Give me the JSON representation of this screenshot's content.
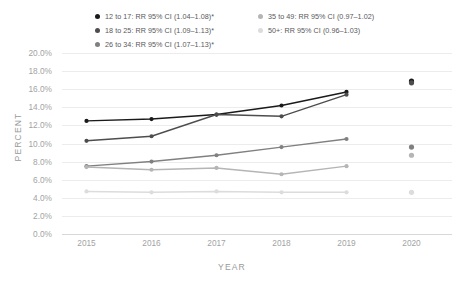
{
  "chart_data": {
    "type": "line",
    "title": "",
    "subtitle": "",
    "xlabel": "YEAR",
    "ylabel": "PERCENT",
    "x": [
      2015,
      2016,
      2017,
      2018,
      2019,
      2020
    ],
    "categories": [
      "2015",
      "2016",
      "2017",
      "2018",
      "2019",
      "2020"
    ],
    "xtick_labels": [
      "2015",
      "2016",
      "2017",
      "2018",
      "2019",
      "2020"
    ],
    "ytick_labels": [
      "0.0%",
      "2.0%",
      "4.0%",
      "6.0%",
      "8.0%",
      "10.0%",
      "12.0%",
      "14.0%",
      "16.0%",
      "18.0%",
      "20.0%"
    ],
    "ytick_values": [
      0,
      2,
      4,
      6,
      8,
      10,
      12,
      14,
      16,
      18,
      20
    ],
    "ylim": [
      0,
      20
    ],
    "grid": true,
    "legend_position": "top",
    "note": "2020 values are plotted as unconnected markers",
    "series": [
      {
        "name": "12 to 17",
        "legend_label": "12 to 17: RR 95% CI (1.04–1.08)*",
        "color": "#1a1a1a",
        "values": [
          12.5,
          12.7,
          13.2,
          14.2,
          15.7,
          16.9
        ],
        "connected": [
          true,
          true,
          true,
          true,
          true,
          false
        ]
      },
      {
        "name": "18 to 25",
        "legend_label": "18 to 25: RR 95% CI (1.09–1.13)*",
        "color": "#4d4d4d",
        "values": [
          10.3,
          10.8,
          13.2,
          13.0,
          15.4,
          16.7
        ],
        "connected": [
          true,
          true,
          true,
          true,
          true,
          false
        ]
      },
      {
        "name": "26 to 34",
        "legend_label": "26 to 34: RR 95% CI (1.07–1.13)*",
        "color": "#808080",
        "values": [
          7.5,
          8.0,
          8.7,
          9.6,
          10.5,
          9.6
        ],
        "connected": [
          true,
          true,
          true,
          true,
          true,
          false
        ]
      },
      {
        "name": "35 to 49",
        "legend_label": "35 to 49: RR 95% CI (0.97–1.02)",
        "color": "#b5b5b5",
        "values": [
          7.4,
          7.1,
          7.3,
          6.6,
          7.5,
          8.7
        ],
        "connected": [
          true,
          true,
          true,
          true,
          true,
          false
        ]
      },
      {
        "name": "50+",
        "legend_label": "50+: RR 95% CI (0.96–1.03)",
        "color": "#dcdcdc",
        "values": [
          4.7,
          4.6,
          4.7,
          4.6,
          4.6,
          4.6
        ],
        "connected": [
          true,
          true,
          true,
          true,
          true,
          false
        ]
      }
    ]
  }
}
